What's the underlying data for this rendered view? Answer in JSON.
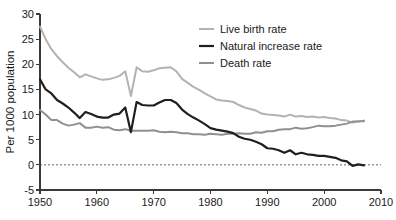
{
  "chart_data": {
    "type": "line",
    "title": "",
    "xlabel": "",
    "ylabel": "Per 1000 population",
    "xlim": [
      1950,
      2010
    ],
    "ylim": [
      -5,
      30
    ],
    "xticks": [
      1950,
      1960,
      1970,
      1980,
      1990,
      2000,
      2010
    ],
    "yticks": [
      -5,
      0,
      5,
      10,
      15,
      20,
      25,
      30
    ],
    "grid": false,
    "zero_reference_line": true,
    "legend_position": "top-right",
    "series": [
      {
        "name": "Live birth rate",
        "color": "#b3b3b3",
        "x": [
          1950,
          1951,
          1952,
          1953,
          1954,
          1955,
          1956,
          1957,
          1958,
          1959,
          1960,
          1961,
          1962,
          1963,
          1964,
          1965,
          1966,
          1967,
          1968,
          1969,
          1970,
          1971,
          1972,
          1973,
          1974,
          1975,
          1976,
          1977,
          1978,
          1979,
          1980,
          1981,
          1982,
          1983,
          1984,
          1985,
          1986,
          1987,
          1988,
          1989,
          1990,
          1991,
          1992,
          1993,
          1994,
          1995,
          1996,
          1997,
          1998,
          1999,
          2000,
          2001,
          2002,
          2003,
          2004,
          2005,
          2006,
          2007
        ],
        "values": [
          27.5,
          25.0,
          23.0,
          21.6,
          20.4,
          19.3,
          18.4,
          17.4,
          18.0,
          17.6,
          17.2,
          16.9,
          17.0,
          17.3,
          17.7,
          18.6,
          13.7,
          19.4,
          18.6,
          18.5,
          18.8,
          19.2,
          19.3,
          19.4,
          18.6,
          17.1,
          16.3,
          15.5,
          14.9,
          14.2,
          13.6,
          13.0,
          12.8,
          12.7,
          12.5,
          11.9,
          11.4,
          11.1,
          10.8,
          10.2,
          10.0,
          9.9,
          9.8,
          9.6,
          10.0,
          9.6,
          9.7,
          9.5,
          9.6,
          9.4,
          9.5,
          9.3,
          9.2,
          8.9,
          8.8,
          8.4,
          8.7,
          8.6
        ]
      },
      {
        "name": "Natural increase rate",
        "color": "#1f1f1f",
        "x": [
          1950,
          1951,
          1952,
          1953,
          1954,
          1955,
          1956,
          1957,
          1958,
          1959,
          1960,
          1961,
          1962,
          1963,
          1964,
          1965,
          1966,
          1967,
          1968,
          1969,
          1970,
          1971,
          1972,
          1973,
          1974,
          1975,
          1976,
          1977,
          1978,
          1979,
          1980,
          1981,
          1982,
          1983,
          1984,
          1985,
          1986,
          1987,
          1988,
          1989,
          1990,
          1991,
          1992,
          1993,
          1994,
          1995,
          1996,
          1997,
          1998,
          1999,
          2000,
          2001,
          2002,
          2003,
          2004,
          2005,
          2006,
          2007
        ],
        "values": [
          17.0,
          15.0,
          14.2,
          12.9,
          12.2,
          11.4,
          10.4,
          9.3,
          10.5,
          10.1,
          9.6,
          9.4,
          9.4,
          10.0,
          10.2,
          11.4,
          6.5,
          12.5,
          11.9,
          11.8,
          11.8,
          12.4,
          12.9,
          12.9,
          12.3,
          11.0,
          10.1,
          9.4,
          8.8,
          8.1,
          7.3,
          7.0,
          6.8,
          6.6,
          6.3,
          5.6,
          5.2,
          5.0,
          4.6,
          4.1,
          3.3,
          3.2,
          2.9,
          2.4,
          2.9,
          2.1,
          2.4,
          2.1,
          2.0,
          1.8,
          1.8,
          1.6,
          1.4,
          0.9,
          0.7,
          -0.2,
          0.1,
          -0.1
        ]
      },
      {
        "name": "Death rate",
        "color": "#909090",
        "x": [
          1950,
          1951,
          1952,
          1953,
          1954,
          1955,
          1956,
          1957,
          1958,
          1959,
          1960,
          1961,
          1962,
          1963,
          1964,
          1965,
          1966,
          1967,
          1968,
          1969,
          1970,
          1971,
          1972,
          1973,
          1974,
          1975,
          1976,
          1977,
          1978,
          1979,
          1980,
          1981,
          1982,
          1983,
          1984,
          1985,
          1986,
          1987,
          1988,
          1989,
          1990,
          1991,
          1992,
          1993,
          1994,
          1995,
          1996,
          1997,
          1998,
          1999,
          2000,
          2001,
          2002,
          2003,
          2004,
          2005,
          2006,
          2007
        ],
        "values": [
          10.9,
          10.0,
          8.9,
          8.9,
          8.2,
          7.8,
          8.0,
          8.3,
          7.4,
          7.4,
          7.6,
          7.4,
          7.5,
          7.0,
          6.9,
          7.1,
          6.8,
          6.8,
          6.8,
          6.8,
          6.9,
          6.6,
          6.5,
          6.6,
          6.5,
          6.3,
          6.3,
          6.1,
          6.1,
          6.0,
          6.2,
          6.1,
          6.0,
          6.2,
          6.2,
          6.3,
          6.2,
          6.2,
          6.5,
          6.4,
          6.7,
          6.7,
          7.0,
          7.1,
          7.1,
          7.4,
          7.2,
          7.3,
          7.5,
          7.8,
          7.7,
          7.7,
          7.8,
          8.0,
          8.2,
          8.6,
          8.6,
          8.8
        ]
      }
    ]
  },
  "axes": {
    "y_title": "Per 1000 population",
    "y_tick_labels": [
      "30",
      "25",
      "20",
      "15",
      "10",
      "5",
      "0",
      "-5"
    ],
    "x_tick_labels": [
      "1950",
      "1960",
      "1970",
      "1980",
      "1990",
      "2000",
      "2010"
    ]
  },
  "legend": {
    "items": [
      {
        "label": "Live birth rate",
        "color": "#b3b3b3",
        "width": 2.0
      },
      {
        "label": "Natural increase rate",
        "color": "#1f1f1f",
        "width": 2.2
      },
      {
        "label": "Death rate",
        "color": "#909090",
        "width": 2.0
      }
    ]
  },
  "colors": {
    "background": "#ffffff",
    "axis": "#3a3a3a",
    "text": "#1a1a1a",
    "zero_line": "#555555"
  }
}
